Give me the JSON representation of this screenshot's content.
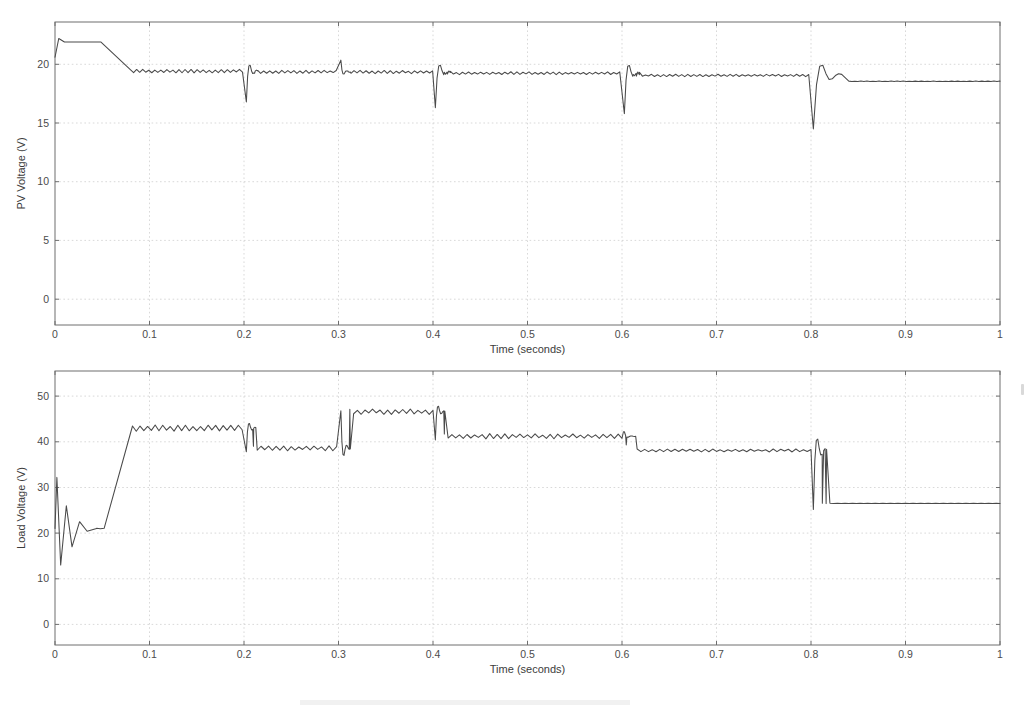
{
  "figure": {
    "background": "#ffffff",
    "trace_color": "#4a4a4a",
    "grid_color": "#c8c8c8",
    "axis_color": "#6e6e6e"
  },
  "chart_data": [
    {
      "id": "pv-voltage",
      "type": "line",
      "title": "",
      "xlabel": "Time (seconds)",
      "ylabel": "PV Voltage (V)",
      "xlim": [
        0,
        1
      ],
      "ylim": [
        -2.2,
        23.6
      ],
      "xticks": [
        0,
        0.1,
        0.2,
        0.3,
        0.4,
        0.5,
        0.6,
        0.7,
        0.8,
        0.9,
        1
      ],
      "xticklabels": [
        "0",
        "0.1",
        "0.2",
        "0.3",
        "0.4",
        "0.5",
        "0.6",
        "0.7",
        "0.8",
        "0.9",
        "1"
      ],
      "yticks": [
        0,
        5,
        10,
        15,
        20
      ],
      "yticklabels": [
        "0",
        "5",
        "10",
        "15",
        "20"
      ],
      "grid": true,
      "legend": "none",
      "series": [
        {
          "name": "PV Voltage",
          "description": "Starts at about 22 V with a small initial overshoot, holds flat until t=0.05 s, ramps down to a rippling 19.4 V plateau, then shows switching transients at each irradiance step.",
          "points": [
            {
              "t": 0.0,
              "v": 20.6
            },
            {
              "t": 0.004,
              "v": 22.2
            },
            {
              "t": 0.01,
              "v": 21.9
            },
            {
              "t": 0.05,
              "v": 21.9
            },
            {
              "t": 0.06,
              "v": 21.4
            },
            {
              "t": 0.072,
              "v": 19.6
            },
            {
              "t": 0.08,
              "v": 19.45
            },
            {
              "t": 0.199,
              "v": 19.4
            },
            {
              "t": 0.202,
              "v": 16.8
            },
            {
              "t": 0.208,
              "v": 19.5
            },
            {
              "t": 0.296,
              "v": 19.35
            },
            {
              "t": 0.302,
              "v": 20.3
            },
            {
              "t": 0.31,
              "v": 19.4
            },
            {
              "t": 0.398,
              "v": 19.35
            },
            {
              "t": 0.403,
              "v": 16.3
            },
            {
              "t": 0.412,
              "v": 19.5
            },
            {
              "t": 0.598,
              "v": 19.2
            },
            {
              "t": 0.603,
              "v": 15.8
            },
            {
              "t": 0.612,
              "v": 19.3
            },
            {
              "t": 0.798,
              "v": 19.0
            },
            {
              "t": 0.804,
              "v": 14.5
            },
            {
              "t": 0.818,
              "v": 19.0
            },
            {
              "t": 0.84,
              "v": 18.6
            },
            {
              "t": 1.0,
              "v": 18.55
            }
          ],
          "plateaus": [
            {
              "t_start": 0.01,
              "t_end": 0.05,
              "level": 21.9,
              "ripple": 0.0
            },
            {
              "t_start": 0.08,
              "t_end": 0.2,
              "level": 19.42,
              "ripple": 0.22
            },
            {
              "t_start": 0.208,
              "t_end": 0.3,
              "level": 19.36,
              "ripple": 0.2
            },
            {
              "t_start": 0.31,
              "t_end": 0.4,
              "level": 19.34,
              "ripple": 0.2
            },
            {
              "t_start": 0.412,
              "t_end": 0.6,
              "level": 19.24,
              "ripple": 0.18
            },
            {
              "t_start": 0.612,
              "t_end": 0.8,
              "level": 19.05,
              "ripple": 0.14
            },
            {
              "t_start": 0.84,
              "t_end": 1.0,
              "level": 18.55,
              "ripple": 0.03
            }
          ],
          "transients": [
            {
              "t": 0.2,
              "direction": "down",
              "peak": 16.8,
              "ring": 0.012
            },
            {
              "t": 0.3,
              "direction": "up",
              "peak": 20.35,
              "ring": 0.01
            },
            {
              "t": 0.4,
              "direction": "down",
              "peak": 16.3,
              "ring": 0.016
            },
            {
              "t": 0.6,
              "direction": "down",
              "peak": 15.8,
              "ring": 0.016
            },
            {
              "t": 0.8,
              "direction": "down",
              "peak": 14.5,
              "ring": 0.03
            }
          ]
        }
      ]
    },
    {
      "id": "load-voltage",
      "type": "line",
      "title": "",
      "xlabel": "Time (seconds)",
      "ylabel": "Load Voltage (V)",
      "xlim": [
        0,
        1
      ],
      "ylim": [
        -4.5,
        55.5
      ],
      "xticks": [
        0,
        0.1,
        0.2,
        0.3,
        0.4,
        0.5,
        0.6,
        0.7,
        0.8,
        0.9,
        1
      ],
      "xticklabels": [
        "0",
        "0.1",
        "0.2",
        "0.3",
        "0.4",
        "0.5",
        "0.6",
        "0.7",
        "0.8",
        "0.9",
        "1"
      ],
      "yticks": [
        0,
        10,
        20,
        30,
        40,
        50
      ],
      "yticklabels": [
        "0",
        "10",
        "20",
        "30",
        "40",
        "50"
      ],
      "grid": true,
      "legend": "none",
      "series": [
        {
          "name": "Load Voltage",
          "description": "Large startup oscillation between 13 V and 32 V, settles at 21 V, steps up to a rippling 43 V plateau at t=0.055 s, then follows the irradiance steps down to 26.5 V after t=0.8 s.",
          "points": [
            {
              "t": 0.0,
              "v": 21.0
            },
            {
              "t": 0.002,
              "v": 32.2
            },
            {
              "t": 0.006,
              "v": 13.0
            },
            {
              "t": 0.012,
              "v": 26.0
            },
            {
              "t": 0.018,
              "v": 17.0
            },
            {
              "t": 0.026,
              "v": 22.5
            },
            {
              "t": 0.034,
              "v": 20.4
            },
            {
              "t": 0.044,
              "v": 21.0
            },
            {
              "t": 0.055,
              "v": 21.0
            },
            {
              "t": 0.062,
              "v": 30.0
            },
            {
              "t": 0.072,
              "v": 41.0
            },
            {
              "t": 0.082,
              "v": 43.0
            },
            {
              "t": 0.199,
              "v": 43.1
            },
            {
              "t": 0.203,
              "v": 37.8
            },
            {
              "t": 0.21,
              "v": 38.6
            },
            {
              "t": 0.298,
              "v": 38.6
            },
            {
              "t": 0.303,
              "v": 44.0
            },
            {
              "t": 0.312,
              "v": 46.5
            },
            {
              "t": 0.399,
              "v": 46.8
            },
            {
              "t": 0.404,
              "v": 40.6
            },
            {
              "t": 0.412,
              "v": 41.2
            },
            {
              "t": 0.598,
              "v": 41.4
            },
            {
              "t": 0.602,
              "v": 42.2
            },
            {
              "t": 0.607,
              "v": 36.8
            },
            {
              "t": 0.616,
              "v": 38.0
            },
            {
              "t": 0.798,
              "v": 38.2
            },
            {
              "t": 0.803,
              "v": 25.4
            },
            {
              "t": 0.812,
              "v": 26.4
            },
            {
              "t": 1.0,
              "v": 26.5
            }
          ],
          "plateaus": [
            {
              "t_start": 0.044,
              "t_end": 0.055,
              "level": 21.0,
              "ripple": 0.12
            },
            {
              "t_start": 0.082,
              "t_end": 0.2,
              "level": 43.0,
              "ripple": 1.0
            },
            {
              "t_start": 0.21,
              "t_end": 0.3,
              "level": 38.6,
              "ripple": 0.8
            },
            {
              "t_start": 0.312,
              "t_end": 0.4,
              "level": 46.6,
              "ripple": 0.85
            },
            {
              "t_start": 0.412,
              "t_end": 0.6,
              "level": 41.2,
              "ripple": 0.8
            },
            {
              "t_start": 0.616,
              "t_end": 0.8,
              "level": 38.1,
              "ripple": 0.45
            },
            {
              "t_start": 0.812,
              "t_end": 1.0,
              "level": 26.5,
              "ripple": 0.05
            }
          ],
          "transients": [
            {
              "t": 0.2,
              "direction": "down",
              "peak": 37.8,
              "ring": 0.01
            },
            {
              "t": 0.3,
              "direction": "up",
              "peak": 46.8,
              "ring": 0.01
            },
            {
              "t": 0.4,
              "direction": "down",
              "peak": 40.4,
              "ring": 0.01
            },
            {
              "t": 0.6,
              "direction": "up-then-down",
              "peak": 42.2,
              "ring": 0.012
            },
            {
              "t": 0.8,
              "direction": "down",
              "peak": 25.2,
              "ring": 0.014
            }
          ]
        }
      ]
    }
  ]
}
